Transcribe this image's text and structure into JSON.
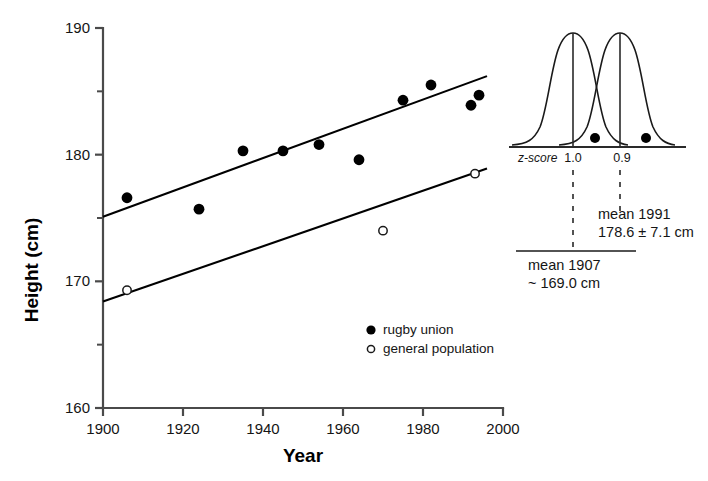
{
  "chart_data": {
    "type": "scatter",
    "title": "",
    "xlabel": "Year",
    "ylabel": "Height (cm)",
    "xlim": [
      1900,
      2000
    ],
    "ylim": [
      160,
      190
    ],
    "grid": false,
    "x_ticks": [
      "1900",
      "1920",
      "1940",
      "1960",
      "1980",
      "2000"
    ],
    "x_tick_values": [
      1900,
      1920,
      1940,
      1960,
      1980,
      2000
    ],
    "y_ticks": [
      "160",
      "170",
      "180",
      "190"
    ],
    "y_tick_values": [
      160,
      170,
      180,
      190
    ],
    "y_minor_tick_values": [
      165,
      175,
      185
    ],
    "legend_position": "lower-right-inside",
    "series": [
      {
        "name": "rugby union",
        "marker": "filled-circle",
        "x": [
          1906,
          1924,
          1935,
          1945,
          1954,
          1964,
          1975,
          1982,
          1992,
          1994
        ],
        "y": [
          176.6,
          175.7,
          180.3,
          180.3,
          180.8,
          179.6,
          184.3,
          185.5,
          183.9,
          184.7
        ]
      },
      {
        "name": "general population",
        "marker": "open-circle",
        "x": [
          1906,
          1970,
          1993
        ],
        "y": [
          169.3,
          174.0,
          178.5
        ]
      }
    ],
    "trend_lines": [
      {
        "name": "rugby union trend",
        "x": [
          1900,
          1996
        ],
        "y": [
          175.1,
          186.2
        ]
      },
      {
        "name": "general population trend",
        "x": [
          1900,
          1996
        ],
        "y": [
          168.4,
          178.9
        ]
      }
    ]
  },
  "legend": {
    "items": [
      {
        "marker": "filled-circle",
        "label": "rugby union"
      },
      {
        "marker": "open-circle",
        "label": "general population"
      }
    ]
  },
  "inset": {
    "type": "distribution-comparison",
    "z_axis_label": "z-score",
    "z_tick_labels": [
      "1.0",
      "0.9"
    ],
    "curves": [
      {
        "name": "1907 distribution",
        "peak_label": "mean 1907"
      },
      {
        "name": "1991 distribution",
        "peak_label": "mean 1991"
      }
    ],
    "annotations": {
      "mean_1991_line1": "mean 1991",
      "mean_1991_line2": "178.6 ± 7.1 cm",
      "mean_1907_line1": "mean 1907",
      "mean_1907_line2": "~ 169.0 cm"
    }
  },
  "colors": {
    "axis": "#4a4a4a",
    "line": "#000000",
    "marker_fill": "#000000",
    "marker_open_stroke": "#1a1a1a",
    "text": "#151515",
    "background": "#ffffff"
  }
}
